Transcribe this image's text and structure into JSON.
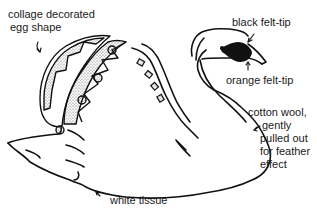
{
  "diagram": {
    "labels": [
      {
        "id": "egg",
        "lines": [
          "collage decorated",
          "egg shape"
        ]
      },
      {
        "id": "eye",
        "lines": [
          "black felt-tip"
        ]
      },
      {
        "id": "beak",
        "lines": [
          "orange felt-tip"
        ]
      },
      {
        "id": "body",
        "lines": [
          "cotton wool,",
          "gently",
          "pulled out",
          "for feather",
          "effect"
        ]
      },
      {
        "id": "base",
        "lines": [
          "white tissue"
        ]
      }
    ]
  },
  "colors": {
    "ink": "#111111",
    "background": "#ffffff",
    "stipple": "#9a9a9a"
  }
}
